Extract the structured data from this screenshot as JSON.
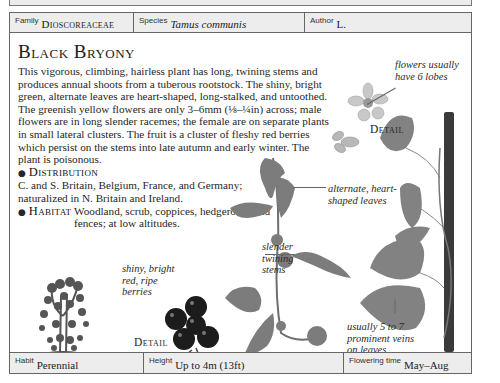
{
  "page": {
    "family_heading": "Yam Family"
  },
  "meta_top": {
    "family": {
      "key": "Family",
      "value": "Dioscoreaceae"
    },
    "species": {
      "key": "Species",
      "value": "Tamus communis"
    },
    "author": {
      "key": "Author",
      "value": "L."
    }
  },
  "entry": {
    "common_name": "Black Bryony",
    "description": "This vigorous, climbing, hairless plant has long, twining stems and produces annual shoots from a tuberous rootstock. The shiny, bright green, alternate leaves are heart-shaped, long-stalked, and untoothed. The greenish yellow flowers are only 3–6mm (⅛–¼in) across; male flowers are in long slender racemes; the female are on separate plants in small lateral clusters. The fruit is a cluster of fleshy red berries which persist on the stems into late autumn and early winter. The plant is poisonous.",
    "distribution": {
      "label": "Distribution",
      "text": "C. and S. Britain, Belgium, France, and Germany; naturalized in N. Britain and Ireland."
    },
    "habitat": {
      "label": "Habitat",
      "text": "Woodland, scrub, coppices, hedgerows, and fences; at low altitudes."
    }
  },
  "annotations": {
    "flowers": "flowers usually have 6 lobes",
    "leaves": "alternate, heart-shaped leaves",
    "stems": "slender twining stems",
    "berries": "shiny, bright red, ripe berries",
    "veins": "usually 5 to 7 prominent veins on leaves",
    "detail_flower": "Detail",
    "detail_berries": "Detail"
  },
  "meta_bottom": {
    "habit": {
      "key": "Habit",
      "value": "Perennial"
    },
    "height": {
      "key": "Height",
      "value": "Up to 4m (13ft)"
    },
    "flowering": {
      "key": "Flowering time",
      "value": "May–Aug"
    }
  },
  "colors": {
    "border": "#666666",
    "meta_bg": "#ededed",
    "leaf": "#7a7a7a",
    "berry": "#1c1c1c",
    "text": "#222222"
  }
}
